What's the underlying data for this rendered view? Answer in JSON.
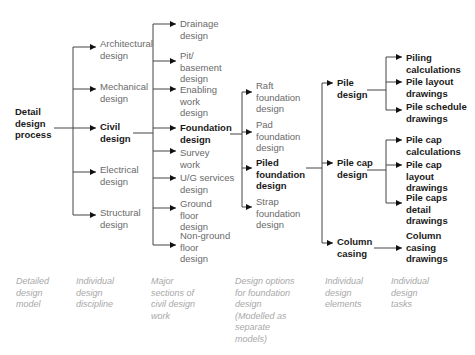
{
  "diagram": {
    "root": {
      "label": "Detail\ndesign\nprocess",
      "emphasis": true
    },
    "disciplines": [
      {
        "label": "Architectural\ndesign",
        "emphasis": false
      },
      {
        "label": "Mechanical\ndesign",
        "emphasis": false
      },
      {
        "label": "Civil\ndesign",
        "emphasis": true
      },
      {
        "label": "Electrical\ndesign",
        "emphasis": false
      },
      {
        "label": "Structural\ndesign",
        "emphasis": false
      }
    ],
    "civil_sections": [
      {
        "label": "Drainage\ndesign",
        "emphasis": false
      },
      {
        "label": "Pit/\nbasement\ndesign",
        "emphasis": false
      },
      {
        "label": "Enabling\nwork\ndesign",
        "emphasis": false
      },
      {
        "label": "Foundation\ndesign",
        "emphasis": true
      },
      {
        "label": "Survey\nwork",
        "emphasis": false
      },
      {
        "label": "U/G services\ndesign",
        "emphasis": false
      },
      {
        "label": "Ground\nfloor\ndesign",
        "emphasis": false
      },
      {
        "label": "Non-ground\nfloor\ndesign",
        "emphasis": false
      }
    ],
    "foundation_options": [
      {
        "label": "Raft\nfoundation\ndesign",
        "emphasis": false
      },
      {
        "label": "Pad\nfoundation\ndesign",
        "emphasis": false
      },
      {
        "label": "Piled\nfoundation\ndesign",
        "emphasis": true
      },
      {
        "label": "Strap\nfoundation\ndesign",
        "emphasis": false
      }
    ],
    "elements": [
      {
        "label": "Pile\ndesign",
        "emphasis": true,
        "tasks": [
          "Piling\ncalculations",
          "Pile layout\ndrawings",
          "Pile schedule\ndrawings"
        ]
      },
      {
        "label": "Pile cap\ndesign",
        "emphasis": true,
        "tasks": [
          "Pile cap\ncalculations",
          "Pile cap\nlayout\ndrawings",
          "Pile caps\ndetail\ndrawings"
        ]
      },
      {
        "label": "Column\ncasing",
        "emphasis": true,
        "tasks": [
          "Column\ncasing\ndrawings"
        ]
      }
    ],
    "column_captions": [
      "Detailed\ndesign\nmodel",
      "Individual\ndesign\ndiscipline",
      "Major\nsections of\ncivil design\nwork",
      "Design options\nfor foundation\ndesign\n(Modelled as\nseparate\nmodels)",
      "Individual\ndesign\nelements",
      "Individual\ndesign\ntasks"
    ]
  }
}
